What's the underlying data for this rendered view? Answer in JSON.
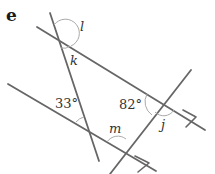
{
  "part_label": "e",
  "angles": {
    "l": "l",
    "k": "k",
    "a33": "33°",
    "a82": "82°",
    "j": "j",
    "m": "m"
  },
  "lines": [
    {
      "name": "upper-parallel-line",
      "x1": 37,
      "y1": 27,
      "x2": 205,
      "y2": 130,
      "arrow": true
    },
    {
      "name": "lower-parallel-line",
      "x1": 8,
      "y1": 84,
      "x2": 156,
      "y2": 171,
      "arrow": true
    },
    {
      "name": "steep-transversal",
      "x1": 50,
      "y1": 13,
      "x2": 99,
      "y2": 161,
      "arrow": false
    },
    {
      "name": "right-transversal",
      "x1": 110,
      "y1": 174,
      "x2": 191,
      "y2": 70,
      "arrow": false
    }
  ]
}
